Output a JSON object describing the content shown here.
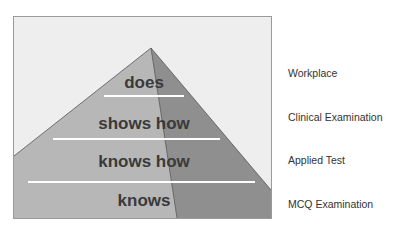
{
  "diagram": {
    "colors": {
      "background": "#eeeeee",
      "left_face": "#b7b7b7",
      "right_face": "#8f8f8f",
      "divider": "#ffffff",
      "text": "#3a3a3a"
    },
    "levels": [
      {
        "label": "does",
        "assessment": "Workplace"
      },
      {
        "label": "shows how",
        "assessment": "Clinical Examination"
      },
      {
        "label": "knows how",
        "assessment": "Applied Test"
      },
      {
        "label": "knows",
        "assessment": "MCQ Examination"
      }
    ]
  }
}
